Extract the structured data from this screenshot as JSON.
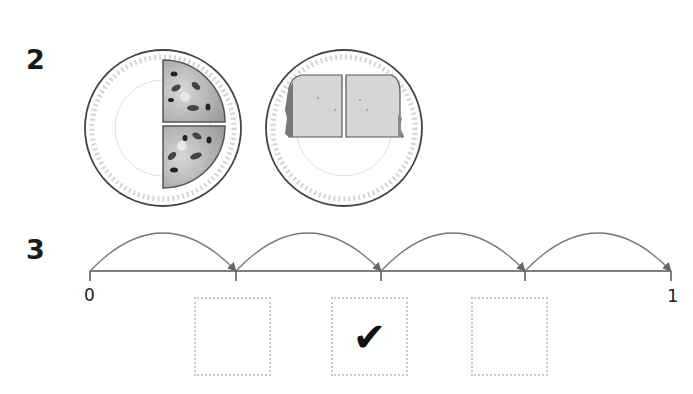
{
  "questions": [
    {
      "number": "2",
      "plates": [
        {
          "name": "pizza-plate",
          "food": "pizza",
          "pieces": 2,
          "portion": "half",
          "description": "half pizza cut into two quarters"
        },
        {
          "name": "bread-plate",
          "food": "bread slice",
          "pieces": 2,
          "portion": "whole",
          "description": "slice of bread cut into two halves"
        }
      ]
    },
    {
      "number": "3",
      "number_line": {
        "start_label": "0",
        "end_label": "1",
        "jumps": 4,
        "ticks": 5
      },
      "answer_boxes": [
        {
          "checked": false,
          "mark": ""
        },
        {
          "checked": true,
          "mark": "✔"
        },
        {
          "checked": false,
          "mark": ""
        }
      ]
    }
  ],
  "colors": {
    "text": "#1a1a1a",
    "line": "#555555",
    "arc": "#777777",
    "plate_rim": "#444444",
    "plate_scallop": "#d0d0d0",
    "pizza_fill": "#b5b5b5",
    "bread_fill": "#d6d6d6",
    "box_border": "#c8c8c8"
  }
}
